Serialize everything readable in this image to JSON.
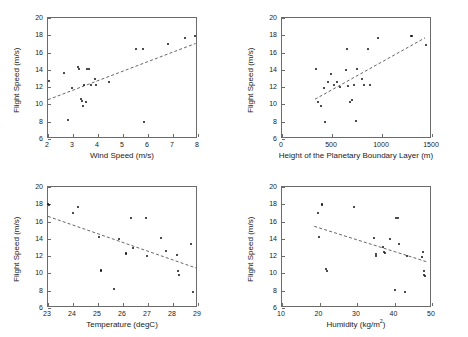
{
  "figure": {
    "title": "",
    "panel_count": 4,
    "shared_ylabel": "Flight Speed (m/s)",
    "marker_color": "#111111",
    "fit_line_color": "#555555",
    "axis_color": "#6b6b6b",
    "background": "#ffffff"
  },
  "chart_data": [
    {
      "type": "scatter",
      "panel": "top-left",
      "title": "",
      "xlabel": "Wind Speed (m/s)",
      "ylabel": "Flight Speed (m/s)",
      "xlim": [
        2,
        8
      ],
      "ylim": [
        6,
        20
      ],
      "xticks": [
        2,
        3,
        4,
        5,
        6,
        7,
        8
      ],
      "xticklabels": [
        "2",
        "3",
        "4",
        "5",
        "6",
        "7",
        "8"
      ],
      "yticks": [
        6,
        8,
        10,
        12,
        14,
        16,
        18,
        20
      ],
      "yticklabels": [
        "6",
        "8",
        "10",
        "12",
        "14",
        "16",
        "18",
        "20"
      ],
      "grid": false,
      "legend": false,
      "x": [
        2.02,
        2.62,
        2.78,
        2.95,
        3.18,
        3.22,
        3.33,
        3.36,
        3.4,
        3.44,
        3.52,
        3.56,
        3.62,
        3.72,
        3.88,
        3.92,
        4.42,
        5.5,
        5.8,
        5.84,
        6.8,
        7.46,
        7.88
      ],
      "y": [
        12.7,
        13.6,
        8.15,
        11.95,
        14.3,
        14.15,
        10.6,
        10.45,
        9.8,
        12.2,
        10.3,
        14.1,
        14.05,
        12.25,
        13.0,
        12.2,
        12.55,
        16.45,
        16.45,
        7.95,
        17.0,
        17.65,
        17.95
      ],
      "trend_line": {
        "style": "dashed",
        "x0": 2.0,
        "y0": 10.55,
        "x1": 7.9,
        "y1": 17.05
      }
    },
    {
      "type": "scatter",
      "panel": "top-right",
      "title": "",
      "xlabel": "Height of the Planetary Boundary Layer (m)",
      "ylabel": "Flight Speed (m/s)",
      "xlim": [
        0,
        1500
      ],
      "ylim": [
        6,
        20
      ],
      "xticks": [
        0,
        500,
        1000,
        1500
      ],
      "xticklabels": [
        "0",
        "500",
        "1000",
        "1500"
      ],
      "yticks": [
        6,
        8,
        10,
        12,
        14,
        16,
        18,
        20
      ],
      "yticklabels": [
        "6",
        "8",
        "10",
        "12",
        "14",
        "16",
        "18",
        "20"
      ],
      "grid": false,
      "legend": false,
      "x": [
        340,
        360,
        385,
        415,
        430,
        455,
        490,
        520,
        545,
        580,
        640,
        650,
        655,
        680,
        700,
        720,
        735,
        745,
        795,
        820,
        860,
        875,
        955,
        1290,
        1300,
        1440
      ],
      "y": [
        14.1,
        10.3,
        9.8,
        11.9,
        7.95,
        12.6,
        13.55,
        12.2,
        12.6,
        12.0,
        14.0,
        16.45,
        12.1,
        10.3,
        10.55,
        12.2,
        8.1,
        14.15,
        13.0,
        12.25,
        16.45,
        12.3,
        17.65,
        17.95,
        17.9,
        16.9
      ],
      "trend_line": {
        "style": "dashed",
        "x0": 330,
        "y0": 10.6,
        "x1": 1430,
        "y1": 17.7
      }
    },
    {
      "type": "scatter",
      "panel": "bottom-left",
      "title": "",
      "xlabel": "Temperature (degC)",
      "ylabel": "Flight Speed (m/s)",
      "xlim": [
        23,
        29
      ],
      "ylim": [
        6,
        20
      ],
      "xticks": [
        23,
        24,
        25,
        26,
        27,
        28,
        29
      ],
      "xticklabels": [
        "23",
        "24",
        "25",
        "26",
        "27",
        "28",
        "29"
      ],
      "yticks": [
        6,
        8,
        10,
        12,
        14,
        16,
        18,
        20
      ],
      "yticklabels": [
        "6",
        "8",
        "10",
        "12",
        "14",
        "16",
        "18",
        "20"
      ],
      "grid": false,
      "legend": false,
      "x": [
        23.02,
        23.04,
        24.0,
        24.2,
        25.02,
        25.1,
        25.12,
        25.62,
        25.82,
        26.1,
        26.12,
        26.32,
        26.38,
        26.92,
        26.96,
        27.5,
        27.7,
        28.16,
        28.2,
        28.24,
        28.72,
        28.78
      ],
      "y": [
        18.0,
        17.9,
        17.0,
        17.65,
        14.25,
        10.45,
        10.25,
        8.15,
        14.0,
        12.35,
        12.25,
        16.45,
        13.0,
        16.45,
        12.05,
        14.05,
        12.55,
        12.1,
        10.3,
        9.8,
        13.45,
        7.9
      ],
      "trend_line": {
        "style": "dashed",
        "x0": 23.0,
        "y0": 16.6,
        "x1": 28.95,
        "y1": 10.6
      }
    },
    {
      "type": "scatter",
      "panel": "bottom-right",
      "title": "",
      "xlabel": "Humidity (kg/m2)",
      "xlabel_base": "Humidity (kg/m",
      "xlabel_sup": "2",
      "xlabel_tail": ")",
      "ylabel": "Flight Speed (m/s)",
      "xlim": [
        10,
        50
      ],
      "ylim": [
        6,
        20
      ],
      "xticks": [
        10,
        20,
        30,
        40,
        50
      ],
      "xticklabels": [
        "10",
        "20",
        "30",
        "40",
        "50"
      ],
      "yticks": [
        6,
        8,
        10,
        12,
        14,
        16,
        18,
        20
      ],
      "yticklabels": [
        "6",
        "8",
        "10",
        "12",
        "14",
        "16",
        "18",
        "20"
      ],
      "grid": false,
      "legend": false,
      "x": [
        19.6,
        19.8,
        20.6,
        20.7,
        21.8,
        22.1,
        29.2,
        34.6,
        35.0,
        35.1,
        36.9,
        37.2,
        37.4,
        38.9,
        40.2,
        40.4,
        41.0,
        41.2,
        42.9,
        43.2,
        47.4,
        47.6,
        47.8,
        47.9,
        48.0
      ],
      "y": [
        17.0,
        14.25,
        18.0,
        17.95,
        10.5,
        10.3,
        17.65,
        14.05,
        12.2,
        12.05,
        13.05,
        12.45,
        12.35,
        14.0,
        8.1,
        16.45,
        16.45,
        13.45,
        7.9,
        12.05,
        11.85,
        12.5,
        10.3,
        9.85,
        9.75
      ],
      "trend_line": {
        "style": "dashed",
        "x0": 18.6,
        "y0": 15.45,
        "x1": 48.6,
        "y1": 11.35
      }
    }
  ]
}
